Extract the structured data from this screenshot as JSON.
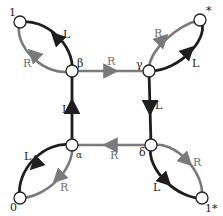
{
  "colors": {
    "L_edge": "#1e1e1e",
    "R_edge": "#7a7a7a",
    "node_fill": "#ffffff",
    "node_stroke": "#222222",
    "background": "#ffffff"
  },
  "nodes": [
    {
      "id": "one",
      "label": "1",
      "x": 20,
      "y": 22
    },
    {
      "id": "beta",
      "label": "β",
      "x": 72,
      "y": 71
    },
    {
      "id": "gamma",
      "label": "γ",
      "x": 149,
      "y": 71
    },
    {
      "id": "star",
      "label": "*",
      "x": 200,
      "y": 20
    },
    {
      "id": "alpha",
      "label": "α",
      "x": 72,
      "y": 145
    },
    {
      "id": "delta",
      "label": "δ",
      "x": 151,
      "y": 145
    },
    {
      "id": "zero",
      "label": "0",
      "x": 20,
      "y": 198
    },
    {
      "id": "onestar",
      "label": "1*",
      "x": 202,
      "y": 198
    }
  ],
  "edges": [
    {
      "from": "beta",
      "to": "gamma",
      "label": "R",
      "type": "R"
    },
    {
      "from": "gamma",
      "to": "delta",
      "label": "L",
      "type": "L"
    },
    {
      "from": "delta",
      "to": "alpha",
      "label": "R",
      "type": "R"
    },
    {
      "from": "alpha",
      "to": "beta",
      "label": "L",
      "type": "L"
    },
    {
      "from": "beta",
      "to": "one",
      "label": "L",
      "type": "L",
      "side": "upper"
    },
    {
      "from": "beta",
      "to": "one",
      "label": "R",
      "type": "R",
      "side": "lower"
    },
    {
      "from": "gamma",
      "to": "star",
      "label": "R",
      "type": "R",
      "side": "upper"
    },
    {
      "from": "gamma",
      "to": "star",
      "label": "L",
      "type": "L",
      "side": "lower"
    },
    {
      "from": "alpha",
      "to": "zero",
      "label": "L",
      "type": "L",
      "side": "upper"
    },
    {
      "from": "alpha",
      "to": "zero",
      "label": "R",
      "type": "R",
      "side": "lower"
    },
    {
      "from": "delta",
      "to": "onestar",
      "label": "R",
      "type": "R",
      "side": "upper"
    },
    {
      "from": "delta",
      "to": "onestar",
      "label": "L",
      "type": "L",
      "side": "lower"
    }
  ],
  "labels": {
    "one": "1",
    "beta": "β",
    "gamma": "γ",
    "star": "*",
    "alpha": "α",
    "delta": "δ",
    "zero": "0",
    "onestar": "1*",
    "edge_beta_gamma": "R",
    "edge_gamma_delta": "L",
    "edge_delta_alpha": "R",
    "edge_alpha_beta": "L",
    "loop1_L": "L",
    "loop1_R": "R",
    "loopstar_R": "R",
    "loopstar_L": "L",
    "loop0_L": "L",
    "loop0_R": "R",
    "loop1star_R": "R",
    "loop1star_L": "L"
  }
}
